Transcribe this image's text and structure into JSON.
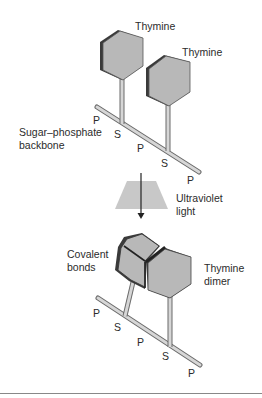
{
  "figure": {
    "top_panel": {
      "thymine_1_label": "Thymine",
      "thymine_2_label": "Thymine",
      "backbone_label_line1": "Sugar–phosphate",
      "backbone_label_line2": "backbone",
      "backbone_units": [
        "P",
        "S",
        "P",
        "S",
        "P"
      ]
    },
    "transition": {
      "label_line1": "Ultraviolet",
      "label_line2": "light"
    },
    "bottom_panel": {
      "bonds_label_line1": "Covalent",
      "bonds_label_line2": "bonds",
      "dimer_label_line1": "Thymine",
      "dimer_label_line2": "dimer",
      "backbone_units": [
        "P",
        "S",
        "P",
        "S",
        "P"
      ]
    },
    "colors": {
      "hexagon_fill": "#b8b8b8",
      "hexagon_edge": "#3a3a3a",
      "backbone_fill": "#d6d6d6",
      "backbone_outline": "#6a6a6a",
      "uv_beam": "#c8c8c8",
      "text": "#2b2b2b",
      "rule": "#888888"
    }
  }
}
